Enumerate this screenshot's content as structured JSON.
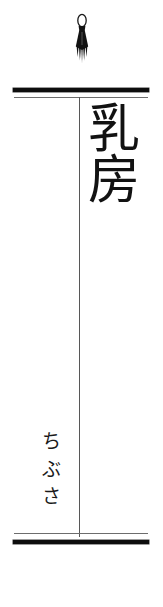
{
  "page": {
    "kind": "japanese-hanging-scroll-label",
    "background_color": "#ffffff",
    "ink_color": "#121212",
    "rule_color": "#575757",
    "width_px": 163,
    "height_px": 607
  },
  "ornament": {
    "name": "tassel",
    "icon": "tassel-icon",
    "color": "#111111"
  },
  "top_rail": {
    "thick_bar_color": "#0d0d0d",
    "thin_line_color": "#6d6d6d"
  },
  "bottom_rail": {
    "thick_bar_color": "#0d0d0d",
    "thin_line_color": "#6d6d6d"
  },
  "divider": {
    "color": "#575757"
  },
  "headword": {
    "text": "乳房",
    "characters": [
      "乳",
      "房"
    ],
    "orientation": "vertical"
  },
  "reading": {
    "text": "ちぶさ",
    "characters": [
      "ち",
      "ぶ",
      "さ"
    ],
    "orientation": "vertical"
  }
}
